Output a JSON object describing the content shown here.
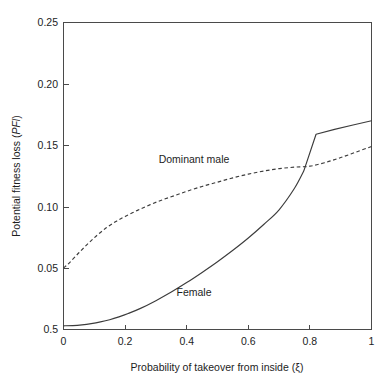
{
  "chart_data": {
    "type": "line",
    "title": "",
    "xlabel": "Probability of takeover from inside (ξ)",
    "ylabel_plain": "Potential fitness loss (",
    "ylabel_em": "PFl",
    "ylabel_tail": ")",
    "xlim": [
      0,
      1
    ],
    "ylim": [
      0,
      0.25
    ],
    "grid": false,
    "legend": "inline-annotations",
    "x_ticks": [
      0,
      0.2,
      0.4,
      0.6,
      0.8,
      1
    ],
    "x_tick_labels": [
      "0",
      "0.2",
      "0.4",
      "0.6",
      "0.8",
      "1"
    ],
    "y_ticks": [
      0,
      0.05,
      0.1,
      0.15,
      0.2,
      0.25
    ],
    "y_tick_labels": [
      "0.5",
      "0.05",
      "0.10",
      "0.15",
      "0.20",
      "0.25"
    ],
    "series": [
      {
        "name": "Dominant male",
        "style": "dashed",
        "color": "#3c3c3c",
        "label_x": 0.42,
        "label_y": 0.153,
        "x": [
          0.0,
          0.02,
          0.05,
          0.08,
          0.11,
          0.14,
          0.17,
          0.2,
          0.24,
          0.28,
          0.32,
          0.36,
          0.4,
          0.45,
          0.5,
          0.55,
          0.6,
          0.65,
          0.7,
          0.75,
          0.8,
          0.85,
          0.9,
          0.95,
          1.0
        ],
        "values": [
          0.05,
          0.0545,
          0.0625,
          0.07,
          0.077,
          0.083,
          0.088,
          0.092,
          0.097,
          0.1015,
          0.1055,
          0.109,
          0.1125,
          0.1165,
          0.12,
          0.1235,
          0.1265,
          0.129,
          0.131,
          0.1322,
          0.133,
          0.136,
          0.14,
          0.1445,
          0.149
        ]
      },
      {
        "name": "Female",
        "style": "solid",
        "color": "#3c3c3c",
        "label_x": 0.42,
        "label_y": 0.032,
        "x": [
          0.0,
          0.03,
          0.06,
          0.09,
          0.12,
          0.15,
          0.18,
          0.21,
          0.25,
          0.3,
          0.35,
          0.4,
          0.45,
          0.5,
          0.55,
          0.6,
          0.65,
          0.7,
          0.75,
          0.78,
          0.82,
          0.88,
          0.94,
          1.0
        ],
        "values": [
          0.003,
          0.0032,
          0.0038,
          0.0048,
          0.0062,
          0.008,
          0.0103,
          0.013,
          0.0172,
          0.0235,
          0.0305,
          0.0382,
          0.0465,
          0.0552,
          0.0645,
          0.0745,
          0.0855,
          0.0975,
          0.115,
          0.129,
          0.159,
          0.163,
          0.1665,
          0.17
        ],
        "kink_x": 0.82,
        "kink_y": 0.159
      }
    ],
    "annotations": [
      {
        "text": "Dominant male",
        "x": 0.42,
        "y": 0.153
      },
      {
        "text": "Female",
        "x": 0.42,
        "y": 0.032
      }
    ],
    "crossing_point": {
      "x": 0.71,
      "y": 0.131
    }
  }
}
